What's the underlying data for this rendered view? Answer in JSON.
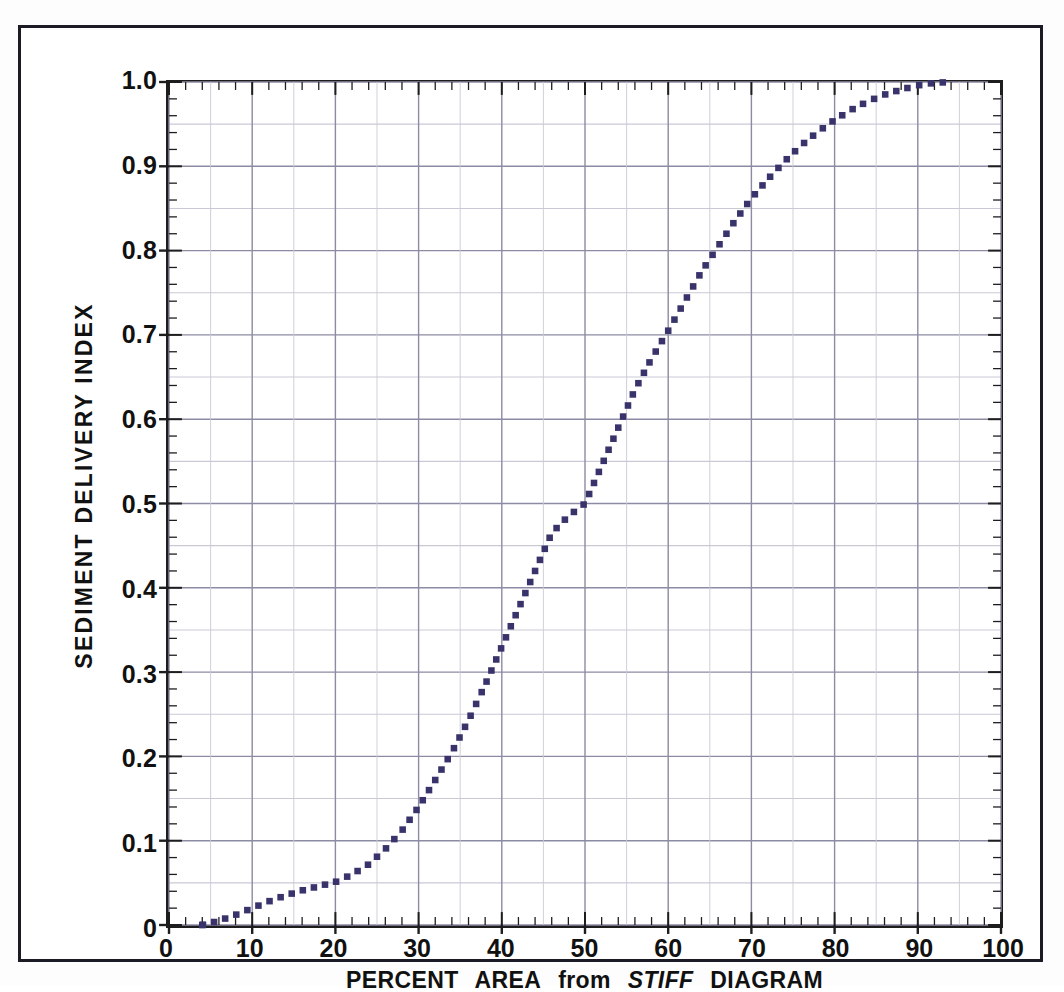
{
  "chart_data": {
    "type": "line",
    "title": "",
    "xlabel": "PERCENT AREA from STIFF DIAGRAM",
    "xlabel_parts": [
      {
        "text": "PERCENT",
        "style": "normal"
      },
      {
        "text": "AREA",
        "style": "normal"
      },
      {
        "text": "from",
        "style": "normal-lower"
      },
      {
        "text": "STIFF",
        "style": "italic"
      },
      {
        "text": "DIAGRAM",
        "style": "normal"
      }
    ],
    "ylabel": "SEDIMENT DELIVERY INDEX",
    "xlim": [
      0,
      100
    ],
    "ylim": [
      0,
      1.0
    ],
    "x_major_step": 10,
    "x_minor_step": 2,
    "y_major_step": 0.1,
    "y_minor_step": 0.02,
    "y_midgrid_step": 0.05,
    "grid": true,
    "legend": "none",
    "xticklabels": [
      "0",
      "10",
      "20",
      "30",
      "40",
      "50",
      "60",
      "70",
      "80",
      "90",
      "100"
    ],
    "yticklabels": [
      "0",
      "0.1",
      "0.2",
      "0.3",
      "0.4",
      "0.5",
      "0.6",
      "0.7",
      "0.8",
      "0.9",
      "1.0"
    ],
    "xtickvalues": [
      0,
      10,
      20,
      30,
      40,
      50,
      60,
      70,
      80,
      90,
      100
    ],
    "ytickvalues": [
      0,
      0.1,
      0.2,
      0.3,
      0.4,
      0.5,
      0.6,
      0.7,
      0.8,
      0.9,
      1.0
    ],
    "series": [
      {
        "name": "Sediment Delivery Index curve",
        "style": "dotted",
        "color": "#39336b",
        "marker": "square",
        "x": [
          4,
          6,
          8,
          10,
          12,
          14,
          16,
          18,
          20,
          22,
          24,
          26,
          28,
          30,
          32,
          34,
          36,
          38,
          40,
          42,
          44,
          46,
          48,
          50,
          52,
          54,
          56,
          58,
          60,
          62,
          64,
          66,
          68,
          70,
          72,
          74,
          76,
          78,
          80,
          82,
          84,
          86,
          88,
          90,
          92,
          94
        ],
        "y": [
          0.0,
          0.005,
          0.012,
          0.02,
          0.028,
          0.035,
          0.041,
          0.046,
          0.051,
          0.06,
          0.072,
          0.09,
          0.112,
          0.14,
          0.172,
          0.205,
          0.243,
          0.285,
          0.33,
          0.375,
          0.42,
          0.465,
          0.485,
          0.5,
          0.545,
          0.59,
          0.635,
          0.672,
          0.705,
          0.74,
          0.775,
          0.805,
          0.835,
          0.862,
          0.885,
          0.906,
          0.925,
          0.941,
          0.955,
          0.967,
          0.977,
          0.985,
          0.991,
          0.996,
          0.999,
          1.0
        ]
      }
    ],
    "colors": {
      "curve": "#39336b",
      "grid_major": "#8b8ba3",
      "grid_minor": "#c9c9d6",
      "axis": "#1d1d1d",
      "frame": "#1b1b25",
      "background": "#ffffff",
      "text": "#111111"
    }
  },
  "axis_titles": {
    "x_word_1": "PERCENT",
    "x_word_2": "AREA",
    "x_word_3": "from",
    "x_word_4": "STIFF",
    "x_word_5": "DIAGRAM",
    "y": "SEDIMENT DELIVERY INDEX"
  }
}
